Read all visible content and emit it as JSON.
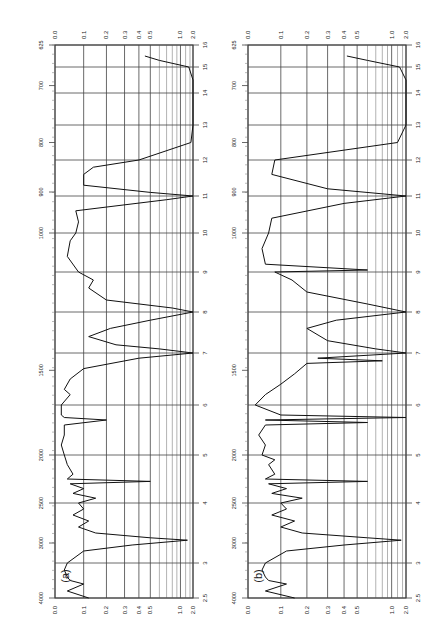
{
  "figure": {
    "panels": [
      {
        "label": "(a)"
      },
      {
        "label": "(b)"
      }
    ]
  },
  "axes": {
    "wavenumber_ticks": [
      "4000",
      "3000",
      "2500",
      "2000",
      "1500",
      "1000",
      "900",
      "800",
      "700",
      "625"
    ],
    "wavelength_ticks": [
      "2.5",
      "3",
      "4",
      "5",
      "6",
      "7",
      "8",
      "9",
      "10",
      "11",
      "12",
      "13",
      "14",
      "15",
      "16"
    ],
    "absorbance_ticks": [
      "0.0",
      "0.1",
      "0.2",
      "0.3",
      "0.4",
      "0.5",
      "1.0",
      "2.0"
    ]
  },
  "chart_data": [
    {
      "type": "line",
      "title": "(a)",
      "xlabel": "Wavelength (µm) / Wavenumber (cm-1)",
      "ylabel": "Absorbance",
      "orientation": "rotated 90° (wavelength increases upward, absorbance increases rightward)",
      "xlim": [
        2.5,
        16
      ],
      "ylim": [
        0.0,
        2.0
      ],
      "grid": true,
      "x_ticks_um": [
        2.5,
        3,
        4,
        5,
        6,
        7,
        8,
        9,
        10,
        11,
        12,
        13,
        14,
        15,
        16
      ],
      "x_ticks_cm": [
        4000,
        3000,
        2500,
        2000,
        1500,
        1000,
        900,
        800,
        700,
        625
      ],
      "y_ticks": [
        0.0,
        0.1,
        0.2,
        0.3,
        0.4,
        0.5,
        1.0,
        2.0
      ],
      "x": [
        2.5,
        2.6,
        2.7,
        2.75,
        2.8,
        2.9,
        3.0,
        3.2,
        3.3,
        3.38,
        3.42,
        3.5,
        3.6,
        3.7,
        3.8,
        3.9,
        4.0,
        4.1,
        4.2,
        4.3,
        4.4,
        4.45,
        4.5,
        4.6,
        4.8,
        5.0,
        5.2,
        5.4,
        5.6,
        5.7,
        5.75,
        5.8,
        6.0,
        6.2,
        6.3,
        6.5,
        6.7,
        6.9,
        7.0,
        7.1,
        7.2,
        7.4,
        7.6,
        7.8,
        8.0,
        8.1,
        8.3,
        8.6,
        8.8,
        9.0,
        9.4,
        9.8,
        10.0,
        10.3,
        10.6,
        10.9,
        11.0,
        11.1,
        11.3,
        11.6,
        11.8,
        12.0,
        12.5,
        13.0,
        13.5,
        14.0,
        14.5,
        15.0,
        15.3,
        15.5
      ],
      "values": [
        0.12,
        0.04,
        0.1,
        0.05,
        0.04,
        0.03,
        0.04,
        0.1,
        0.35,
        1.3,
        0.5,
        0.15,
        0.08,
        0.12,
        0.06,
        0.1,
        0.08,
        0.15,
        0.06,
        0.1,
        0.05,
        0.5,
        0.04,
        0.06,
        0.04,
        0.03,
        0.02,
        0.03,
        0.03,
        0.2,
        0.03,
        0.02,
        0.02,
        0.05,
        0.03,
        0.05,
        0.1,
        0.4,
        2.0,
        0.6,
        0.25,
        0.12,
        0.22,
        0.5,
        2.0,
        0.8,
        0.2,
        0.12,
        0.14,
        0.08,
        0.04,
        0.05,
        0.07,
        0.08,
        0.07,
        0.7,
        2.0,
        0.5,
        0.1,
        0.1,
        0.14,
        0.4,
        1.6,
        2.0,
        2.0,
        2.0,
        2.0,
        1.4,
        0.6,
        0.45
      ]
    },
    {
      "type": "line",
      "title": "(b)",
      "xlabel": "Wavelength (µm) / Wavenumber (cm-1)",
      "ylabel": "Absorbance",
      "orientation": "rotated 90° (wavelength increases upward, absorbance increases rightward)",
      "xlim": [
        2.5,
        16
      ],
      "ylim": [
        0.0,
        2.0
      ],
      "grid": true,
      "x_ticks_um": [
        2.5,
        3,
        4,
        5,
        6,
        7,
        8,
        9,
        10,
        11,
        12,
        13,
        14,
        15,
        16
      ],
      "x_ticks_cm": [
        4000,
        3000,
        2500,
        2000,
        1500,
        1000,
        900,
        800,
        700,
        625
      ],
      "y_ticks": [
        0.0,
        0.1,
        0.2,
        0.3,
        0.4,
        0.5,
        1.0,
        2.0
      ],
      "x": [
        2.5,
        2.6,
        2.7,
        2.75,
        2.8,
        2.9,
        3.0,
        3.2,
        3.3,
        3.38,
        3.42,
        3.5,
        3.6,
        3.7,
        3.8,
        3.9,
        4.0,
        4.1,
        4.2,
        4.3,
        4.4,
        4.45,
        4.5,
        4.6,
        4.8,
        4.9,
        5.0,
        5.2,
        5.4,
        5.6,
        5.65,
        5.7,
        5.75,
        5.8,
        6.0,
        6.2,
        6.4,
        6.6,
        6.8,
        6.85,
        6.9,
        7.0,
        7.1,
        7.3,
        7.6,
        7.8,
        8.0,
        8.2,
        8.5,
        8.8,
        9.0,
        9.05,
        9.2,
        9.6,
        10.0,
        10.4,
        10.8,
        11.0,
        11.2,
        11.6,
        12.0,
        12.5,
        13.0,
        13.5,
        14.0,
        14.5,
        15.0,
        15.3,
        15.5
      ],
      "values": [
        0.15,
        0.05,
        0.12,
        0.06,
        0.05,
        0.04,
        0.05,
        0.12,
        0.4,
        1.4,
        0.6,
        0.18,
        0.1,
        0.15,
        0.07,
        0.12,
        0.1,
        0.18,
        0.07,
        0.12,
        0.06,
        0.6,
        0.05,
        0.08,
        0.06,
        0.08,
        0.04,
        0.05,
        0.03,
        0.05,
        0.6,
        0.05,
        2.0,
        0.1,
        0.02,
        0.05,
        0.1,
        0.15,
        0.2,
        0.8,
        0.25,
        2.0,
        0.7,
        0.3,
        0.2,
        0.35,
        2.0,
        0.6,
        0.2,
        0.14,
        0.08,
        0.6,
        0.05,
        0.04,
        0.06,
        0.07,
        0.4,
        2.0,
        0.3,
        0.07,
        0.08,
        1.2,
        2.0,
        2.0,
        2.0,
        2.0,
        1.3,
        0.6,
        0.42
      ]
    }
  ]
}
